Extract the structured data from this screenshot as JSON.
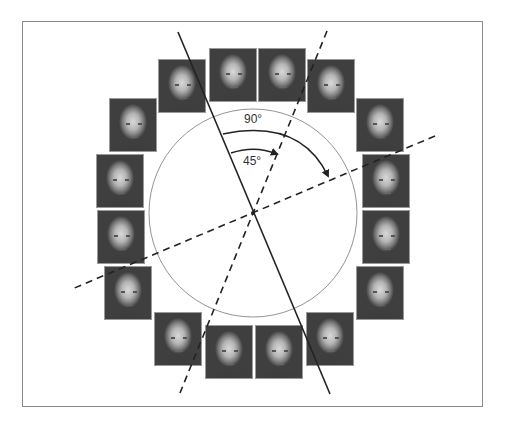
{
  "figure": {
    "type": "face-orientation-diagram",
    "labels": {
      "angle_large": "90°",
      "angle_small": "45°"
    },
    "colors": {
      "line": "#222222",
      "circle": "#777777",
      "frame": "#8a8a8a",
      "face_bg": "#3f3f3f"
    },
    "circle": {
      "cx": 253,
      "cy": 213,
      "r": 104
    },
    "faces": [
      {
        "id": 1,
        "x": 209,
        "y": 48
      },
      {
        "id": 2,
        "x": 258,
        "y": 48
      },
      {
        "id": 3,
        "x": 307,
        "y": 59
      },
      {
        "id": 4,
        "x": 356,
        "y": 98
      },
      {
        "id": 5,
        "x": 362,
        "y": 154
      },
      {
        "id": 6,
        "x": 362,
        "y": 210
      },
      {
        "id": 7,
        "x": 356,
        "y": 266
      },
      {
        "id": 8,
        "x": 306,
        "y": 312
      },
      {
        "id": 9,
        "x": 255,
        "y": 325
      },
      {
        "id": 10,
        "x": 205,
        "y": 325
      },
      {
        "id": 11,
        "x": 154,
        "y": 312
      },
      {
        "id": 12,
        "x": 104,
        "y": 266
      },
      {
        "id": 13,
        "x": 97,
        "y": 210
      },
      {
        "id": 14,
        "x": 96,
        "y": 154
      },
      {
        "id": 15,
        "x": 109,
        "y": 98
      },
      {
        "id": 16,
        "x": 158,
        "y": 59
      }
    ],
    "lines": {
      "solid_axis": {
        "x1": 178,
        "y1": 32,
        "x2": 330,
        "y2": 394,
        "style": "solid"
      },
      "dashed_45": {
        "x1": 327,
        "y1": 31,
        "x2": 180,
        "y2": 393,
        "style": "dashed"
      },
      "dashed_90": {
        "x1": 435,
        "y1": 136,
        "x2": 72,
        "y2": 289,
        "style": "dashed"
      }
    }
  }
}
